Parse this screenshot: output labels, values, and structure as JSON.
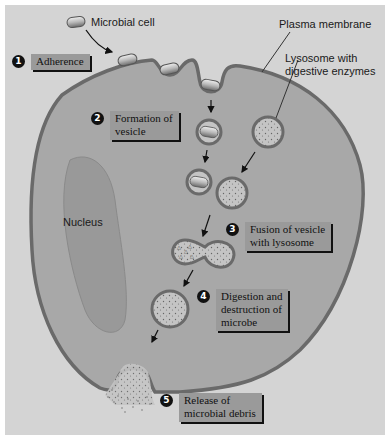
{
  "labels": {
    "microbial_cell": "Microbial cell",
    "plasma_membrane": "Plasma membrane",
    "lysosome": "Lysosome with\ndigestive enzymes",
    "lysosome_line1": "Lysosome with",
    "lysosome_line2": "digestive enzymes",
    "nucleus": "Nucleus"
  },
  "steps": [
    {
      "number": "1",
      "text": "Adherence"
    },
    {
      "number": "2",
      "text": "Formation of\nvesicle"
    },
    {
      "number": "3",
      "text": "Fusion of vesicle\nwith lysosome"
    },
    {
      "number": "4",
      "text": "Digestion and\ndestruction of\nmicrobe"
    },
    {
      "number": "5",
      "text": "Release of\nmicrobial debris"
    }
  ],
  "colors": {
    "background": "#d4d4d4",
    "cytoplasm": "#a8a8a8",
    "membrane": "#6a6a6a",
    "nucleus": "#999999",
    "label_box": "#9a9a9a"
  }
}
